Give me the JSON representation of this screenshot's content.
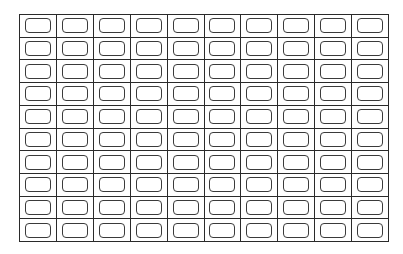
{
  "worksheet": {
    "grid": {
      "rows": 10,
      "columns": 10,
      "cell_content": "empty-rounded-box",
      "line_color": "#2a2a2a",
      "box_color": "#3a3a3a",
      "background": "#ffffff"
    }
  }
}
